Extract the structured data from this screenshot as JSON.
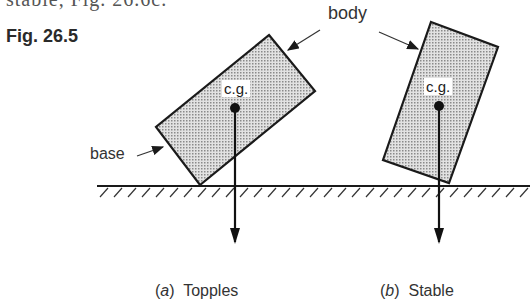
{
  "header": {
    "partial_text": "stable, Fig. 26.6c.",
    "figure_label": "Fig. 26.5"
  },
  "labels": {
    "body": "body",
    "base": "base",
    "cg_left": "c.g.",
    "cg_right": "c.g."
  },
  "captions": {
    "a_letter": "a",
    "a_text": "Topples",
    "b_letter": "b",
    "b_text": "Stable"
  },
  "colors": {
    "outline": "#1a1a1a",
    "fill": "#c8c8c8"
  }
}
